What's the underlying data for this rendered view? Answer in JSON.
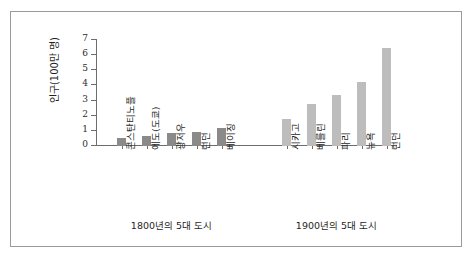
{
  "chart_data": {
    "type": "bar",
    "title": "",
    "subtitle": "",
    "xlabel": "",
    "ylabel": "인구(100만 명)",
    "ylim": [
      0,
      7
    ],
    "ytick_labels": [
      "7",
      "6",
      "5",
      "4",
      "3",
      "2",
      "1",
      "0"
    ],
    "ytick_values": [
      7,
      6,
      5,
      4,
      3,
      2,
      1,
      0
    ],
    "grid": false,
    "legend": "none",
    "categories": [
      "콘스탄티노플",
      "에도(도쿄)",
      "광저우",
      "런던",
      "베이징",
      "시카고",
      "베를린",
      "파리",
      "뉴욕",
      "런던"
    ],
    "values": [
      0.55,
      0.65,
      0.85,
      0.95,
      1.2,
      1.8,
      2.8,
      3.4,
      4.25,
      6.5
    ],
    "groups": [
      {
        "caption": "1800년의 5대 도시",
        "color": "#8a8a8a",
        "categories": [
          "콘스탄티노플",
          "에도(도쿄)",
          "광저우",
          "런던",
          "베이징"
        ],
        "values": [
          0.55,
          0.65,
          0.85,
          0.95,
          1.2
        ]
      },
      {
        "caption": "1900년의 5대 도시",
        "color": "#bdbdbd",
        "categories": [
          "시카고",
          "베를린",
          "파리",
          "뉴욕",
          "런던"
        ],
        "values": [
          1.8,
          2.8,
          3.4,
          4.25,
          6.5
        ]
      }
    ]
  },
  "axis": {
    "y_title": "인구(100만 명)",
    "y_ticks": [
      "7",
      "6",
      "5",
      "4",
      "3",
      "2",
      "1",
      "0"
    ]
  },
  "captions": {
    "group1": "1800년의 5대 도시",
    "group2": "1900년의 5대 도시"
  },
  "colors": {
    "group1_bar": "#8a8a8a",
    "group2_bar": "#bdbdbd",
    "axis": "#6d6d6d",
    "frame": "#9a9a9a",
    "text": "#1f1f1f",
    "background": "#ffffff"
  }
}
